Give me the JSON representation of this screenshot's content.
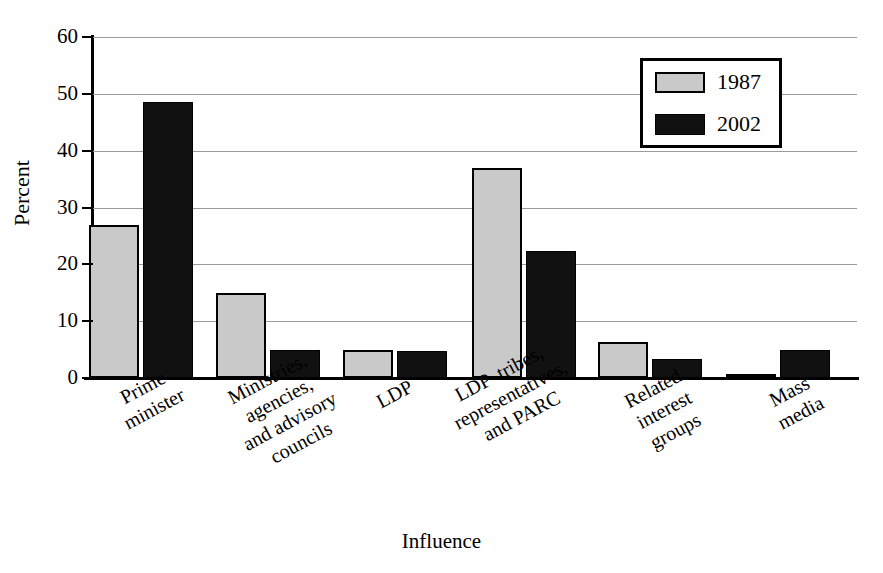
{
  "chart_data": {
    "type": "bar",
    "title": "",
    "xlabel": "Influence",
    "ylabel": "Percent",
    "ylim": [
      0,
      60
    ],
    "yticks": [
      0,
      10,
      20,
      30,
      40,
      50,
      60
    ],
    "grid": true,
    "legend_position": "top-right",
    "categories": [
      "Prime\nminister",
      "Ministries,\nagencies,\nand advisory\ncouncils",
      "LDP",
      "LDP  tribes,\nrepresentatives,\nand PARC",
      "Related\ninterest\ngroups",
      "Mass\nmedia"
    ],
    "series": [
      {
        "name": "1987",
        "color": "#c9c9c9",
        "values": [
          27.0,
          15.0,
          5.0,
          37.0,
          6.3,
          0.4
        ]
      },
      {
        "name": "2002",
        "color": "#111111",
        "values": [
          48.5,
          5.0,
          4.7,
          22.3,
          3.3,
          5.0
        ]
      }
    ]
  },
  "axes": {
    "y_title": "Percent",
    "x_title": "Influence",
    "y_tick_labels": [
      "60",
      "50",
      "40",
      "30",
      "20",
      "10",
      "0"
    ]
  },
  "legend": {
    "entries": [
      {
        "label": "1987",
        "swatch": "gray-swatch"
      },
      {
        "label": "2002",
        "swatch": "black-swatch"
      }
    ]
  }
}
